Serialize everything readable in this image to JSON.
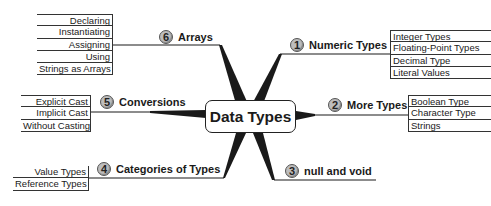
{
  "center": {
    "label": "Data Types"
  },
  "branches": [
    {
      "number": "1",
      "label": "Numeric Types",
      "items": [
        "Integer Types",
        "Floating-Point Types",
        "Decimal Type",
        "Literal Values"
      ]
    },
    {
      "number": "2",
      "label": "More Types",
      "items": [
        "Boolean Type",
        "Character Type",
        "Strings"
      ]
    },
    {
      "number": "3",
      "label": "null and void",
      "items": []
    },
    {
      "number": "4",
      "label": "Categories of Types",
      "items": [
        "Value Types",
        "Reference Types"
      ]
    },
    {
      "number": "5",
      "label": "Conversions",
      "items": [
        "Explicit Cast",
        "Implicit Cast",
        "Without Casting"
      ]
    },
    {
      "number": "6",
      "label": "Arrays",
      "items": [
        "Declaring",
        "Instantiating",
        "Assigning",
        "Using",
        "Strings as Arrays"
      ]
    }
  ],
  "colors": {
    "line": "#1a1a1a",
    "badge": "#bdbdbd",
    "background": "#ffffff"
  }
}
